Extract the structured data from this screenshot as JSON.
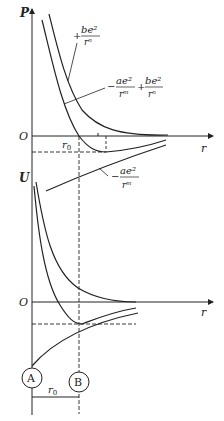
{
  "diagram": {
    "top_plot": {
      "y_axis_label": "P",
      "x_axis_label": "r",
      "origin_label": "O",
      "equilibrium_label": "r",
      "equilibrium_subscript": "0",
      "curves": [
        {
          "name": "repulsive",
          "sign": "+",
          "numerator": "be²",
          "denominator": "rⁿ"
        },
        {
          "name": "total",
          "term1_sign": "−",
          "term1_numerator": "ae²",
          "term1_denominator": "rᵐ",
          "term2_sign": "+",
          "term2_numerator": "be²",
          "term2_denominator": "rⁿ"
        },
        {
          "name": "attractive",
          "sign": "−",
          "numerator": "ae²",
          "denominator": "rᵐ"
        }
      ]
    },
    "bottom_plot": {
      "y_axis_label": "U",
      "x_axis_label": "r",
      "origin_label": "O"
    },
    "atoms": [
      {
        "label": "A"
      },
      {
        "label": "B"
      }
    ],
    "separation_label": "r",
    "separation_subscript": "0"
  }
}
